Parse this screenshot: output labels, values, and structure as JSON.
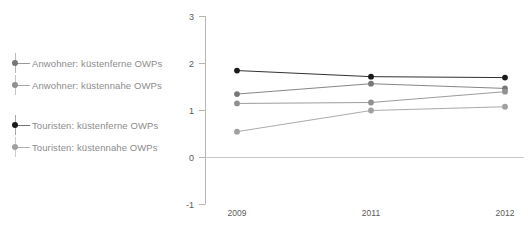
{
  "chart_data": {
    "type": "line",
    "title": "",
    "xlabel": "",
    "ylabel": "",
    "categories": [
      "2009",
      "2011",
      "2012"
    ],
    "x": [
      2009,
      2011,
      2012
    ],
    "ylim": [
      -1,
      3
    ],
    "yticks": [
      -1,
      0,
      1,
      2,
      3
    ],
    "ytick_labels": [
      "-1",
      "0",
      "1",
      "2",
      "3"
    ],
    "grid": false,
    "zero_line": true,
    "legend_position": "left",
    "series": [
      {
        "name": "Anwohner: küstenferne OWPs",
        "values": [
          1.35,
          1.57,
          1.47
        ],
        "color": "#777777",
        "marker": "circle"
      },
      {
        "name": "Anwohner: küstennahe OWPs",
        "values": [
          1.15,
          1.17,
          1.4
        ],
        "color": "#909090",
        "marker": "circle"
      },
      {
        "name": "Touristen: küstenferne OWPs",
        "values": [
          1.85,
          1.72,
          1.7
        ],
        "color": "#1a1a1a",
        "marker": "circle"
      },
      {
        "name": "Touristen: küstennahe OWPs",
        "values": [
          0.55,
          1.0,
          1.08
        ],
        "color": "#a0a0a0",
        "marker": "circle"
      }
    ]
  },
  "legend": {
    "entries": [
      {
        "label": "Anwohner: küstenferne OWPs",
        "color": "#777777"
      },
      {
        "label": "Anwohner: küstennahe OWPs",
        "color": "#909090"
      },
      {
        "label": "Touristen: küstenferne OWPs",
        "color": "#1a1a1a"
      },
      {
        "label": "Touristen: küstennahe OWPs",
        "color": "#a0a0a0"
      }
    ]
  },
  "axis": {
    "y_labels": [
      "3",
      "2",
      "1",
      "0",
      "-1"
    ],
    "x_labels": [
      "2009",
      "2011",
      "2012"
    ],
    "axis_color": "#b5b5b5"
  }
}
